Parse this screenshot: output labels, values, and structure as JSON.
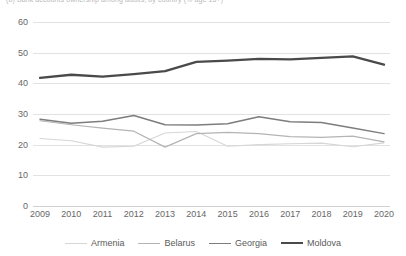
{
  "caption": {
    "text": "(b) Bank accounts ownership among adults, by country (% age 15+)"
  },
  "chart_data": {
    "type": "line",
    "title": "",
    "subtitle": "",
    "xlabel": "",
    "ylabel": "",
    "categories": [
      "2009",
      "2010",
      "2011",
      "2012",
      "2013",
      "2014",
      "2015",
      "2016",
      "2017",
      "2018",
      "2019",
      "2020"
    ],
    "x": [
      2009,
      2010,
      2011,
      2012,
      2013,
      2014,
      2015,
      2016,
      2017,
      2018,
      2019,
      2020
    ],
    "ylim": [
      0,
      60
    ],
    "yticks": [
      0,
      10,
      20,
      30,
      40,
      50,
      60
    ],
    "grid": true,
    "legend_position": "bottom",
    "series": [
      {
        "name": "Armenia",
        "color": "#d6d6d6",
        "width": 1.1,
        "values": [
          22.0,
          21.3,
          19.2,
          19.5,
          23.8,
          24.3,
          19.5,
          20.0,
          20.3,
          20.5,
          19.3,
          20.6
        ]
      },
      {
        "name": "Belarus",
        "color": "#b4b4b4",
        "width": 1.2,
        "values": [
          27.8,
          26.5,
          25.4,
          24.4,
          19.2,
          23.6,
          24.0,
          23.6,
          22.6,
          22.4,
          22.8,
          20.9
        ]
      },
      {
        "name": "Georgia",
        "color": "#7d7d7d",
        "width": 1.5,
        "values": [
          28.3,
          27.0,
          27.6,
          29.5,
          26.5,
          26.4,
          26.8,
          29.1,
          27.5,
          27.2,
          25.4,
          23.6
        ]
      },
      {
        "name": "Moldova",
        "color": "#4a4a4a",
        "width": 2.3,
        "values": [
          41.8,
          42.8,
          42.2,
          43.0,
          44.0,
          47.0,
          47.4,
          48.0,
          47.8,
          48.3,
          48.8,
          46.1
        ]
      }
    ]
  },
  "legend": {
    "items": [
      {
        "label": "Armenia"
      },
      {
        "label": "Belarus"
      },
      {
        "label": "Georgia"
      },
      {
        "label": "Moldova"
      }
    ]
  }
}
